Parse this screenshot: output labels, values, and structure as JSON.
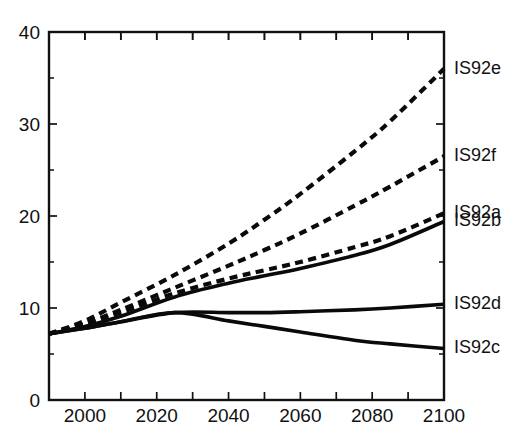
{
  "chart_data": {
    "type": "line",
    "title": "",
    "subtitle": "",
    "xlabel": "",
    "ylabel": "",
    "xlim": [
      1990,
      2100
    ],
    "ylim": [
      0,
      40
    ],
    "grid": false,
    "legend_position": "right-inline-labels",
    "x_ticks_major": [
      2000,
      2020,
      2040,
      2060,
      2080,
      2100
    ],
    "x_ticks_minor": [
      1990,
      2010,
      2030,
      2050,
      2070,
      2090
    ],
    "y_ticks_major": [
      0,
      10,
      20,
      30,
      40
    ],
    "y_ticks_minor": [
      5,
      15,
      25,
      35
    ],
    "x_tick_labels": [
      "2000",
      "2020",
      "2040",
      "2060",
      "2080",
      "2100"
    ],
    "y_tick_labels": [
      "0",
      "10",
      "20",
      "30",
      "40"
    ],
    "series": [
      {
        "name": "IS92e",
        "label": "IS92e",
        "style": "dashed",
        "x": [
          1990,
          2000,
          2010,
          2025,
          2040,
          2050,
          2060,
          2075,
          2085,
          2100
        ],
        "values": [
          7.2,
          8.6,
          10.6,
          13.6,
          17.0,
          19.6,
          22.4,
          27.0,
          30.3,
          36.0
        ]
      },
      {
        "name": "IS92f",
        "label": "IS92f",
        "style": "dashed",
        "x": [
          1990,
          2000,
          2010,
          2025,
          2040,
          2050,
          2060,
          2075,
          2085,
          2100
        ],
        "values": [
          7.2,
          8.3,
          9.8,
          12.2,
          14.6,
          16.3,
          18.1,
          21.1,
          23.2,
          26.5
        ]
      },
      {
        "name": "IS92a",
        "label": "IS92a",
        "style": "dashed",
        "x": [
          1990,
          2000,
          2010,
          2025,
          2040,
          2050,
          2060,
          2075,
          2085,
          2100
        ],
        "values": [
          7.2,
          8.2,
          9.5,
          11.6,
          13.2,
          14.1,
          15.0,
          16.6,
          17.8,
          20.3
        ]
      },
      {
        "name": "IS92b",
        "label": "IS92b",
        "style": "solid",
        "x": [
          1990,
          2000,
          2010,
          2025,
          2040,
          2050,
          2060,
          2075,
          2085,
          2100
        ],
        "values": [
          7.2,
          8.0,
          9.1,
          11.2,
          12.7,
          13.5,
          14.3,
          15.7,
          16.9,
          19.4
        ]
      },
      {
        "name": "IS92d",
        "label": "IS92d",
        "style": "solid",
        "x": [
          1990,
          2000,
          2010,
          2025,
          2040,
          2050,
          2060,
          2075,
          2085,
          2100
        ],
        "values": [
          7.2,
          7.8,
          8.5,
          9.5,
          9.5,
          9.5,
          9.6,
          9.8,
          10.0,
          10.4
        ]
      },
      {
        "name": "IS92c",
        "label": "IS92c",
        "style": "solid",
        "x": [
          1990,
          2000,
          2010,
          2025,
          2040,
          2050,
          2060,
          2075,
          2085,
          2100
        ],
        "values": [
          7.2,
          7.8,
          8.5,
          9.5,
          8.6,
          8.0,
          7.4,
          6.5,
          6.1,
          5.6
        ]
      }
    ],
    "series_labels": [
      {
        "text": "IS92e",
        "value": 36.0
      },
      {
        "text": "IS92f",
        "value": 26.5
      },
      {
        "text": "IS92a",
        "value": 20.3
      },
      {
        "text": "IS92b",
        "value": 19.4
      },
      {
        "text": "IS92d",
        "value": 10.4
      },
      {
        "text": "IS92c",
        "value": 5.6
      }
    ],
    "colors": {
      "line": "#0a0a0a",
      "axis": "#111111",
      "background": "#ffffff"
    }
  }
}
